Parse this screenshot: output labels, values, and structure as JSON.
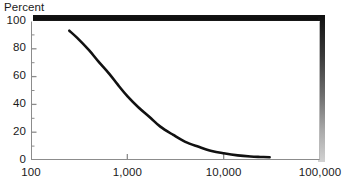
{
  "chart_data": {
    "type": "line",
    "title": "",
    "ylabel": "Percent",
    "xlabel": "",
    "xscale": "log",
    "xlim": [
      100,
      100000
    ],
    "ylim": [
      0,
      100
    ],
    "grid": false,
    "legend": null,
    "x_ticks": [
      {
        "value": 100,
        "label": "100"
      },
      {
        "value": 1000,
        "label": "1,000"
      },
      {
        "value": 10000,
        "label": "10,000"
      },
      {
        "value": 100000,
        "label": "100,000"
      }
    ],
    "y_ticks": [
      {
        "value": 100,
        "label": "100"
      },
      {
        "value": 90,
        "label": ""
      },
      {
        "value": 80,
        "label": "80"
      },
      {
        "value": 70,
        "label": ""
      },
      {
        "value": 60,
        "label": "60"
      },
      {
        "value": 50,
        "label": ""
      },
      {
        "value": 40,
        "label": "40"
      },
      {
        "value": 30,
        "label": ""
      },
      {
        "value": 20,
        "label": "20"
      },
      {
        "value": 10,
        "label": ""
      },
      {
        "value": 0,
        "label": "0"
      }
    ],
    "series": [
      {
        "name": "percent",
        "color": "#111111",
        "x": [
          250,
          300,
          400,
          500,
          650,
          800,
          1000,
          1300,
          1700,
          2200,
          3000,
          4000,
          5500,
          7500,
          10000,
          14000,
          19000,
          24000,
          30000
        ],
        "values": [
          93,
          88,
          79,
          71,
          62,
          54,
          46,
          38,
          31,
          24,
          18,
          13,
          9.5,
          6.5,
          4.8,
          3.3,
          2.5,
          2.2,
          2.0
        ]
      }
    ]
  },
  "axis_title": "Percent",
  "colors": {
    "curve": "#111111",
    "axis": "#8c8c8c",
    "shadow": "#101010",
    "text": "#1a1a1a"
  }
}
